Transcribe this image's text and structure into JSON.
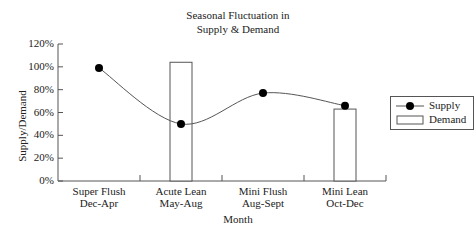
{
  "chart_data": {
    "type": "bar+line",
    "title_lines": [
      "Seasonal Fluctuation in",
      "Supply & Demand"
    ],
    "xlabel": "Month",
    "ylabel": "Supply/Demand",
    "ylim": [
      0,
      120
    ],
    "yticks": [
      "0%",
      "20%",
      "40%",
      "60%",
      "80%",
      "100%",
      "120%"
    ],
    "categories": [
      [
        "Super Flush",
        "Dec-Apr"
      ],
      [
        "Acute Lean",
        "May-Aug"
      ],
      [
        "Mini Flush",
        "Aug-Sept"
      ],
      [
        "Mini Lean",
        "Oct-Dec"
      ]
    ],
    "series": [
      {
        "name": "Supply",
        "type": "line",
        "values": [
          99,
          50,
          77,
          66
        ]
      },
      {
        "name": "Demand",
        "type": "bar",
        "values": [
          0,
          104,
          0,
          63
        ]
      }
    ],
    "legend": {
      "position": "right",
      "entries": [
        "Supply",
        "Demand"
      ]
    },
    "grid": false
  }
}
